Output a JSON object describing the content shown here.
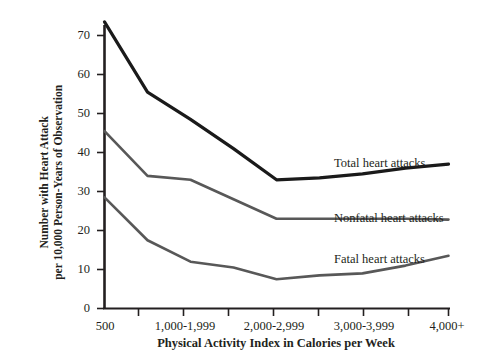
{
  "chart_data": {
    "type": "line",
    "title": "",
    "xlabel": "Physical Activity Index in Calories per Week",
    "ylabel": "Number with Heart Attack per 10,000 Person-Years of Observation",
    "ylabel_line1": "Number with Heart Attack",
    "ylabel_line2": "per 10,000 Person-Years of Observation",
    "categories": [
      "500",
      "",
      "1,000-1,999",
      "",
      "2,000-2,999",
      "",
      "3,000-3,999",
      "",
      "4,000+"
    ],
    "x_tick_labels": [
      "500",
      "1,000-1,999",
      "2,000-2,999",
      "3,000-3,999",
      "4,000+"
    ],
    "x_tick_label_positions": [
      0,
      2,
      4,
      6,
      8
    ],
    "x_tick_count": 9,
    "y_ticks": [
      0,
      10,
      20,
      30,
      40,
      50,
      60,
      70
    ],
    "ylim": [
      0,
      76
    ],
    "grid": false,
    "legend_position": "inline-right",
    "series": [
      {
        "name": "Total heart attacks",
        "color": "#1a1a1a",
        "width": 3.2,
        "label_x": 334,
        "label_y": 157,
        "values": [
          73.5,
          55.5,
          48.5,
          41.0,
          33.0,
          33.5,
          34.5,
          36.0,
          37.0
        ],
        "x_indices": [
          0,
          1,
          2,
          3,
          4,
          5,
          6,
          7,
          8
        ]
      },
      {
        "name": "Nonfatal heart attacks",
        "color": "#585858",
        "width": 2.6,
        "label_x": 334,
        "label_y": 212,
        "values": [
          45.5,
          34.0,
          33.0,
          28.0,
          23.0,
          23.0,
          23.0,
          23.0,
          22.8
        ],
        "x_indices": [
          0,
          1,
          2,
          3,
          4,
          5,
          6,
          7,
          8
        ]
      },
      {
        "name": "Fatal heart attacks",
        "color": "#585858",
        "width": 2.6,
        "label_x": 334,
        "label_y": 253,
        "values": [
          28.5,
          17.5,
          12.0,
          10.5,
          7.5,
          8.5,
          9.0,
          11.0,
          13.5
        ],
        "x_indices": [
          0,
          1,
          2,
          3,
          4,
          5,
          6,
          7,
          8
        ]
      }
    ]
  },
  "axes": {
    "y_tick_labels": [
      "70",
      "60",
      "50",
      "40",
      "30",
      "20",
      "10",
      "0"
    ],
    "x_tick_labels": [
      "500",
      "1,000-1,999",
      "2,000-2,999",
      "3,000-3,999",
      "4,000+"
    ]
  }
}
